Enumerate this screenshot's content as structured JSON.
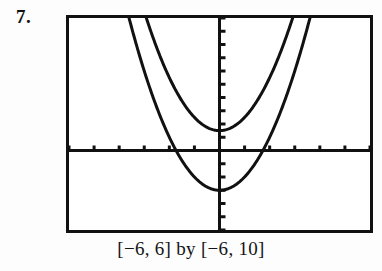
{
  "exercise": {
    "number_label": "7."
  },
  "caption": {
    "text": "[−6, 6] by [−6, 10]"
  },
  "screen": {
    "border_color": "#111111",
    "background_color": "#ffffff",
    "curve_color": "#111111",
    "axis_color": "#111111"
  },
  "chart_data": {
    "type": "line",
    "title": "",
    "xlabel": "",
    "ylabel": "",
    "xlim": [
      -6,
      6
    ],
    "ylim": [
      -6,
      10
    ],
    "x_tick_interval": 1,
    "y_tick_interval": 1,
    "grid": false,
    "legend": "none",
    "axes_shown": [
      "x-axis",
      "y-axis"
    ],
    "window_notation": "[−6, 6] by [−6, 10]",
    "series": [
      {
        "name": "narrow-parabola",
        "type": "parabola",
        "equation": "y = x^2 + 1.5",
        "a": 1,
        "vertex": [
          0,
          1.5
        ],
        "opens": "up",
        "x_intercepts": [],
        "y_intercept": 1.5,
        "x": [
          -2.9,
          -2.6,
          -2.3,
          -2.0,
          -1.7,
          -1.4,
          -1.1,
          -0.8,
          -0.5,
          -0.2,
          0,
          0.2,
          0.5,
          0.8,
          1.1,
          1.4,
          1.7,
          2.0,
          2.3,
          2.6,
          2.9
        ],
        "y": [
          9.91,
          8.26,
          6.79,
          5.5,
          4.39,
          3.46,
          2.71,
          2.14,
          1.75,
          1.54,
          1.5,
          1.54,
          1.75,
          2.14,
          2.71,
          3.46,
          4.39,
          5.5,
          6.79,
          8.26,
          9.91
        ]
      },
      {
        "name": "wide-parabola",
        "type": "parabola",
        "equation": "y = x^2 − 3",
        "a": 1,
        "vertex": [
          0,
          -3
        ],
        "opens": "up",
        "x_intercepts": [
          -1.73,
          1.73
        ],
        "y_intercept": -3,
        "x": [
          -3.6,
          -3.2,
          -2.8,
          -2.4,
          -2.0,
          -1.6,
          -1.2,
          -0.8,
          -0.4,
          0,
          0.4,
          0.8,
          1.2,
          1.6,
          2.0,
          2.4,
          2.8,
          3.2,
          3.6
        ],
        "y": [
          9.96,
          7.24,
          4.84,
          2.76,
          1.0,
          -0.44,
          -1.56,
          -2.36,
          -2.84,
          -3,
          -2.84,
          -2.36,
          -1.56,
          -0.44,
          1.0,
          2.76,
          4.84,
          7.24,
          9.96
        ]
      }
    ]
  }
}
